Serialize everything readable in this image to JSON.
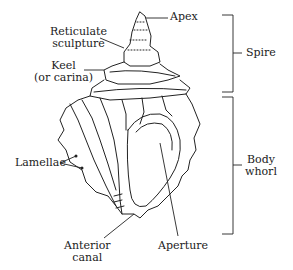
{
  "diagram": {
    "labels": {
      "apex": "Apex",
      "reticulate_sculpture": "Reticulate\nsculpture",
      "keel": "Keel\n(or carina)",
      "spire": "Spire",
      "lamellae": "Lamellae",
      "body_whorl": "Body\nwhorl",
      "anterior_canal": "Anterior\ncanal",
      "aperture": "Aperture"
    },
    "colors": {
      "ink": "#222222",
      "background": "#ffffff"
    }
  }
}
